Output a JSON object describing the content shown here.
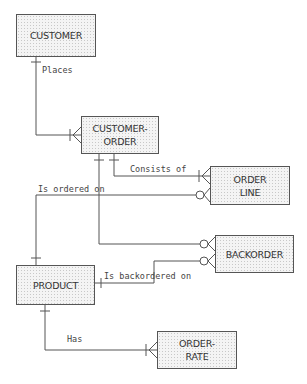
{
  "diagram": {
    "type": "entity-relationship",
    "entities": [
      {
        "id": "customer",
        "label": "CUSTOMER"
      },
      {
        "id": "customer_order",
        "label": "CUSTOMER-\nORDER"
      },
      {
        "id": "order_line",
        "label": "ORDER\nLINE"
      },
      {
        "id": "backorder",
        "label": "BACKORDER"
      },
      {
        "id": "product",
        "label": "PRODUCT"
      },
      {
        "id": "order_rate",
        "label": "ORDER-\nRATE"
      }
    ],
    "relationships": [
      {
        "label": "Places",
        "from": "CUSTOMER",
        "to": "CUSTOMER-ORDER",
        "from_cardinality": "one",
        "to_cardinality": "one-or-many"
      },
      {
        "label": "Consists of",
        "from": "CUSTOMER-ORDER",
        "to": "ORDER LINE",
        "from_cardinality": "one",
        "to_cardinality": "one-or-many"
      },
      {
        "label": "Is ordered on",
        "from": "PRODUCT",
        "to": "ORDER LINE",
        "from_cardinality": "one",
        "to_cardinality": "zero-or-many"
      },
      {
        "label": "",
        "from": "CUSTOMER-ORDER",
        "to": "BACKORDER",
        "from_cardinality": "one",
        "to_cardinality": "zero-or-many"
      },
      {
        "label": "Is backordered on",
        "from": "PRODUCT",
        "to": "BACKORDER",
        "from_cardinality": "one",
        "to_cardinality": "zero-or-many"
      },
      {
        "label": "Has",
        "from": "PRODUCT",
        "to": "ORDER-RATE",
        "from_cardinality": "one",
        "to_cardinality": "one-or-many"
      }
    ]
  }
}
